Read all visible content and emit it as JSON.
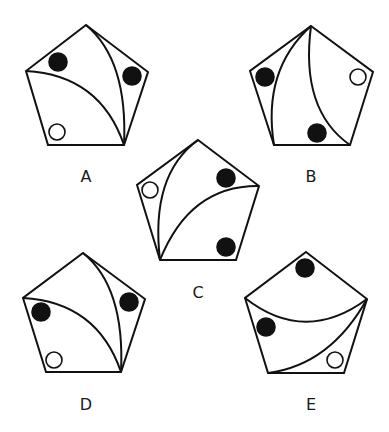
{
  "colors": {
    "stroke": "#111111",
    "black_circle": "#111111",
    "white_circle": "#ffffff",
    "background": "#ffffff"
  },
  "figures": [
    {
      "label": "A",
      "label_pos": [
        86,
        182
      ],
      "pentagon": [
        [
          86,
          25
        ],
        [
          148,
          72
        ],
        [
          124,
          145
        ],
        [
          48,
          145
        ],
        [
          26,
          71
        ]
      ],
      "arcs": [
        "M26,71 Q100,75 124,145",
        "M86,25 Q128,60 124,145"
      ],
      "circles": [
        {
          "type": "black",
          "cx": 58,
          "cy": 62,
          "r": 9
        },
        {
          "type": "black",
          "cx": 132,
          "cy": 76,
          "r": 9
        },
        {
          "type": "white",
          "cx": 57,
          "cy": 132,
          "r": 8
        }
      ]
    },
    {
      "label": "B",
      "label_pos": [
        311,
        182
      ],
      "pentagon": [
        [
          311,
          26
        ],
        [
          373,
          72
        ],
        [
          350,
          145
        ],
        [
          274,
          145
        ],
        [
          250,
          71
        ]
      ],
      "arcs": [
        "M311,26 Q262,70 274,145",
        "M311,26 Q300,110 350,145"
      ],
      "circles": [
        {
          "type": "black",
          "cx": 265,
          "cy": 77,
          "r": 9
        },
        {
          "type": "black",
          "cx": 317,
          "cy": 133,
          "r": 9
        },
        {
          "type": "white",
          "cx": 358,
          "cy": 77,
          "r": 8
        }
      ]
    },
    {
      "label": "C",
      "label_pos": [
        198,
        298
      ],
      "pentagon": [
        [
          198,
          140
        ],
        [
          259,
          186
        ],
        [
          236,
          260
        ],
        [
          160,
          260
        ],
        [
          137,
          185
        ]
      ],
      "arcs": [
        "M160,260 Q150,175 198,140",
        "M160,260 Q190,185 259,186"
      ],
      "circles": [
        {
          "type": "black",
          "cx": 226,
          "cy": 178,
          "r": 9
        },
        {
          "type": "black",
          "cx": 226,
          "cy": 247,
          "r": 9
        },
        {
          "type": "white",
          "cx": 150,
          "cy": 190,
          "r": 8
        }
      ]
    },
    {
      "label": "D",
      "label_pos": [
        86,
        410
      ],
      "pentagon": [
        [
          83,
          253
        ],
        [
          145,
          299
        ],
        [
          121,
          372
        ],
        [
          46,
          372
        ],
        [
          23,
          298
        ]
      ],
      "arcs": [
        "M23,298 Q97,302 121,372",
        "M83,253 Q125,287 121,372"
      ],
      "circles": [
        {
          "type": "black",
          "cx": 41,
          "cy": 312,
          "r": 9
        },
        {
          "type": "black",
          "cx": 129,
          "cy": 302,
          "r": 9
        },
        {
          "type": "white",
          "cx": 54,
          "cy": 360,
          "r": 8
        }
      ]
    },
    {
      "label": "E",
      "label_pos": [
        311,
        410
      ],
      "pentagon": [
        [
          306,
          252
        ],
        [
          367,
          299
        ],
        [
          344,
          373
        ],
        [
          268,
          373
        ],
        [
          245,
          298
        ]
      ],
      "arcs": [
        "M245,298 Q305,345 367,299",
        "M367,299 Q330,365 268,373"
      ],
      "circles": [
        {
          "type": "black",
          "cx": 305,
          "cy": 268,
          "r": 9
        },
        {
          "type": "black",
          "cx": 266,
          "cy": 327,
          "r": 9
        },
        {
          "type": "white",
          "cx": 335,
          "cy": 360,
          "r": 8
        }
      ]
    }
  ]
}
